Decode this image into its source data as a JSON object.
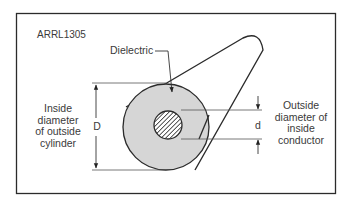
{
  "figure": {
    "id_label": "ARRL1305",
    "dielectric_label": "Dielectric",
    "D_symbol": "D",
    "d_symbol": "d",
    "left_caption": [
      "Inside",
      "diameter",
      "of outside",
      "cylinder"
    ],
    "right_caption": [
      "Outside",
      "diameter of",
      "inside",
      "conductor"
    ],
    "colors": {
      "border": "#2b2b2b",
      "dielectric_fill": "#d6d6d6",
      "line": "#333333",
      "background": "#ffffff"
    }
  }
}
